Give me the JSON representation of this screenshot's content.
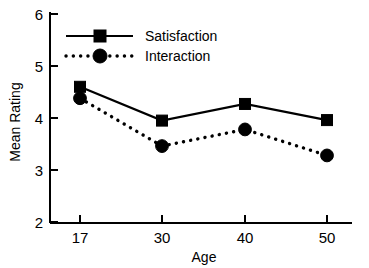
{
  "chart_data": {
    "type": "line",
    "title": "",
    "xlabel": "Age",
    "ylabel": "Mean Rating",
    "categories": [
      "17",
      "30",
      "40",
      "50"
    ],
    "x": [
      17,
      30,
      40,
      50
    ],
    "xtick_labels": [
      "17",
      "30",
      "40",
      "50"
    ],
    "ytick_labels": [
      "2",
      "3",
      "4",
      "5",
      "6"
    ],
    "yticks": [
      2,
      3,
      4,
      5,
      6
    ],
    "ylim": [
      2,
      6
    ],
    "grid": false,
    "legend_position": "upper-left-inside",
    "series": [
      {
        "name": "Satisfaction",
        "values": [
          4.6,
          3.95,
          4.27,
          3.96
        ],
        "marker": "square",
        "linestyle": "solid",
        "color": "#000000"
      },
      {
        "name": "Interaction",
        "values": [
          4.38,
          3.46,
          3.78,
          3.28
        ],
        "marker": "circle",
        "linestyle": "dotted",
        "color": "#000000"
      }
    ]
  },
  "axes": {
    "y_axis_title": "Mean Rating",
    "x_axis_title": "Age",
    "y_tick_2": "2",
    "y_tick_3": "3",
    "y_tick_4": "4",
    "y_tick_5": "5",
    "y_tick_6": "6",
    "x_tick_17": "17",
    "x_tick_30": "30",
    "x_tick_40": "40",
    "x_tick_50": "50"
  },
  "legend": {
    "entry_satisfaction": "Satisfaction",
    "entry_interaction": "Interaction"
  },
  "colors": {
    "ink": "#000000",
    "background": "#ffffff"
  }
}
